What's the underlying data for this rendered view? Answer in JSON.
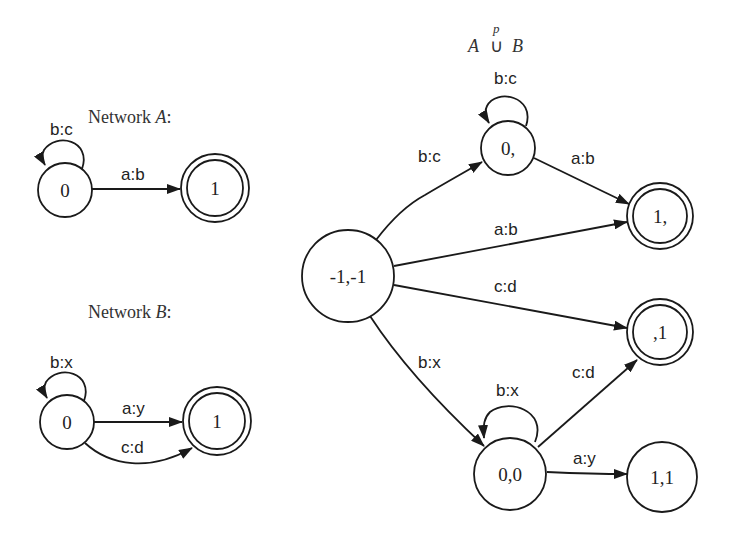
{
  "network_a": {
    "title_prefix": "Network ",
    "title_var": "A",
    "title_suffix": ":",
    "states": [
      {
        "id": "0",
        "label": "0",
        "final": false
      },
      {
        "id": "1",
        "label": "1",
        "final": true
      }
    ],
    "transitions": [
      {
        "from": "0",
        "to": "0",
        "label": "b:c"
      },
      {
        "from": "0",
        "to": "1",
        "label": "a:b"
      }
    ]
  },
  "network_b": {
    "title_prefix": "Network ",
    "title_var": "B",
    "title_suffix": ":",
    "states": [
      {
        "id": "0",
        "label": "0",
        "final": false
      },
      {
        "id": "1",
        "label": "1",
        "final": true
      }
    ],
    "transitions": [
      {
        "from": "0",
        "to": "0",
        "label": "b:x"
      },
      {
        "from": "0",
        "to": "1",
        "label": "a:y"
      },
      {
        "from": "0",
        "to": "1",
        "label": "c:d"
      }
    ]
  },
  "union": {
    "title_left": "A",
    "title_op": "∪",
    "title_sup": "p",
    "title_right": "B",
    "states": [
      {
        "id": "-1,-1",
        "label": "-1,-1",
        "final": false
      },
      {
        "id": "0,",
        "label": "0,",
        "final": false
      },
      {
        "id": "1,",
        "label": "1,",
        "final": true
      },
      {
        "id": ",1",
        "label": ",1",
        "final": true
      },
      {
        "id": "0,0",
        "label": "0,0",
        "final": false
      },
      {
        "id": "1,1",
        "label": "1,1",
        "final": false
      }
    ],
    "transitions": [
      {
        "from": "-1,-1",
        "to": "0,",
        "label": "b:c"
      },
      {
        "from": "0,",
        "to": "0,",
        "label": "b:c"
      },
      {
        "from": "0,",
        "to": "1,",
        "label": "a:b"
      },
      {
        "from": "-1,-1",
        "to": "1,",
        "label": "a:b"
      },
      {
        "from": "-1,-1",
        "to": ",1",
        "label": "c:d"
      },
      {
        "from": "-1,-1",
        "to": "0,0",
        "label": "b:x"
      },
      {
        "from": "0,0",
        "to": "0,0",
        "label": "b:x"
      },
      {
        "from": "0,0",
        "to": ",1",
        "label": "c:d"
      },
      {
        "from": "0,0",
        "to": "1,1",
        "label": "a:y"
      }
    ]
  }
}
